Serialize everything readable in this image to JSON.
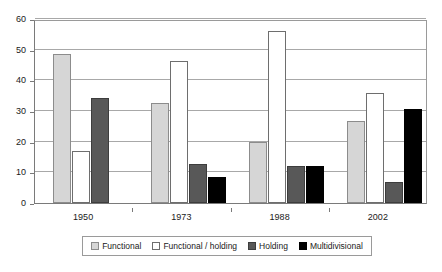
{
  "chart_data": {
    "type": "bar",
    "title": "",
    "subtitle": "",
    "xlabel": "",
    "ylabel": "",
    "categories": [
      "1950",
      "1973",
      "1988",
      "2002"
    ],
    "series": [
      {
        "name": "Functional",
        "color": "#d6d6d6",
        "values": [
          48.5,
          32.5,
          19.8,
          26.7
        ]
      },
      {
        "name": "Functional / holding",
        "color": "#ffffff",
        "values": [
          17.0,
          46.3,
          56.0,
          36.0
        ]
      },
      {
        "name": "Holding",
        "color": "#585858",
        "values": [
          34.2,
          12.7,
          12.0,
          6.7
        ]
      },
      {
        "name": "Multidivisional",
        "color": "#000000",
        "values": [
          0,
          8.5,
          12.1,
          30.7
        ]
      }
    ],
    "ylim": [
      0,
      60
    ],
    "yticks": [
      0,
      10,
      20,
      30,
      40,
      50,
      60
    ],
    "ytick_labels": [
      "0",
      "10",
      "20",
      "30",
      "40",
      "50",
      "60"
    ],
    "grid": true,
    "grid_axis": "y",
    "legend_position": "bottom",
    "legend_entries": [
      "Functional",
      "Functional / holding",
      "Holding",
      "Multidivisional"
    ]
  }
}
